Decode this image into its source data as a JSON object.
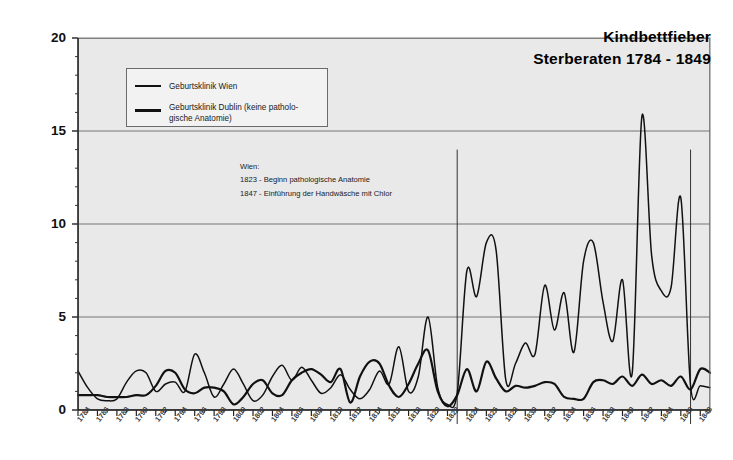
{
  "chart_data": {
    "type": "line",
    "title": "Kindbettfieber",
    "subtitle": "Sterberaten 1784 - 1849",
    "xlabel": "",
    "ylabel": "Anteil der Patientinnen in %, die an Kindbettfieber verstorben sind",
    "ylim": [
      0,
      20
    ],
    "yticks": [
      0,
      5,
      10,
      15,
      20
    ],
    "xlim": [
      1784,
      1849
    ],
    "xticks": [
      1784,
      1786,
      1788,
      1790,
      1792,
      1794,
      1796,
      1798,
      1800,
      1802,
      1804,
      1806,
      1808,
      1810,
      1812,
      1814,
      1816,
      1818,
      1820,
      1822,
      1824,
      1826,
      1828,
      1830,
      1832,
      1834,
      1836,
      1838,
      1840,
      1842,
      1844,
      1846,
      1848
    ],
    "grid": true,
    "legend_position": "upper-left",
    "x": [
      1784,
      1785,
      1786,
      1787,
      1788,
      1789,
      1790,
      1791,
      1792,
      1793,
      1794,
      1795,
      1796,
      1797,
      1798,
      1799,
      1800,
      1801,
      1802,
      1803,
      1804,
      1805,
      1806,
      1807,
      1808,
      1809,
      1810,
      1811,
      1812,
      1813,
      1814,
      1815,
      1816,
      1817,
      1818,
      1819,
      1820,
      1821,
      1822,
      1823,
      1824,
      1825,
      1826,
      1827,
      1828,
      1829,
      1830,
      1831,
      1832,
      1833,
      1834,
      1835,
      1836,
      1837,
      1838,
      1839,
      1840,
      1841,
      1842,
      1843,
      1844,
      1845,
      1846,
      1847,
      1848,
      1849
    ],
    "series": [
      {
        "name": "Geburtsklinik Wien",
        "color": "#111111",
        "values": [
          2.1,
          1.2,
          0.6,
          0.5,
          0.6,
          1.5,
          2.1,
          2.0,
          1.0,
          1.4,
          1.5,
          1.0,
          3.0,
          2.0,
          0.7,
          1.4,
          2.2,
          1.4,
          0.5,
          0.8,
          1.8,
          2.4,
          1.6,
          2.3,
          1.6,
          0.9,
          1.2,
          1.9,
          1.1,
          0.6,
          1.1,
          2.1,
          1.4,
          3.4,
          1.0,
          1.8,
          5.0,
          1.2,
          0.3,
          0.9,
          7.5,
          6.1,
          9.0,
          8.6,
          1.6,
          2.5,
          3.6,
          3.0,
          6.7,
          4.3,
          6.3,
          3.1,
          8.0,
          9.0,
          5.8,
          3.7,
          7.0,
          2.0,
          15.8,
          8.3,
          6.4,
          6.6,
          11.4,
          1.3,
          1.3,
          1.2
        ]
      },
      {
        "name": "Geburtsklinik Dublin (keine pathologische Anatomie)",
        "color": "#111111",
        "values": [
          0.8,
          0.8,
          0.8,
          0.7,
          0.7,
          0.7,
          0.8,
          0.8,
          1.3,
          2.1,
          2.0,
          1.1,
          0.9,
          1.2,
          1.2,
          1.0,
          0.3,
          0.7,
          1.4,
          1.6,
          0.9,
          0.8,
          1.6,
          2.0,
          2.2,
          1.9,
          1.5,
          2.2,
          0.4,
          1.8,
          2.6,
          2.5,
          1.3,
          0.7,
          1.4,
          2.5,
          3.2,
          1.0,
          0.2,
          0.8,
          2.2,
          1.0,
          2.6,
          1.7,
          1.0,
          1.3,
          1.2,
          1.3,
          1.5,
          1.4,
          0.7,
          0.6,
          0.6,
          1.5,
          1.6,
          1.4,
          1.8,
          1.3,
          1.9,
          1.4,
          1.6,
          1.3,
          1.8,
          1.1,
          2.2,
          2.0
        ]
      }
    ],
    "vertical_markers": [
      {
        "year": 1823,
        "label": "Beginn pathologische Anatomie",
        "top_value": 14.0
      },
      {
        "year": 1847,
        "label": "Einführung der Handwäsche mit Chlor",
        "top_value": 14.0
      }
    ],
    "annotations": {
      "heading": "Wien:",
      "lines": [
        "1823 - Beginn pathologische Anatomie",
        "1847 - Einführung der Handwäsche mit Chlor"
      ]
    },
    "legend": [
      {
        "label": "Geburtsklinik Wien",
        "line_width": 1.6
      },
      {
        "label": "Geburtsklinik Dublin (keine patholo-",
        "label2": "gische Anatomie)",
        "line_width": 2.6
      }
    ]
  }
}
